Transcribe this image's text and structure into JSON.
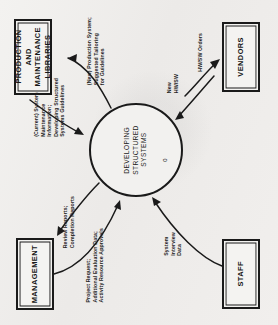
{
  "diagram": {
    "type": "data-flow-diagram",
    "level": "context",
    "orientation": "rotated-90-counterclockwise",
    "process": {
      "name": "DEVELOPING\nSTRUCTURED\nSYSTEMS",
      "id": "0"
    },
    "entities": [
      {
        "key": "production",
        "label": "PRODUCTION\nAND\nMAINTENANCE\nLIBRARIES"
      },
      {
        "key": "vendors",
        "label": "VENDORS"
      },
      {
        "key": "management",
        "label": "MANAGEMENT"
      },
      {
        "key": "staff",
        "label": "STAFF"
      }
    ],
    "flows": [
      {
        "key": "current_system",
        "label": "(Current) System\nMaintenance\nInformation;\nDeveloping Structured\nSystems Guidelines",
        "from": "production",
        "to": "process"
      },
      {
        "key": "new_production",
        "label": "(New) Production System;\nSuggested Tailoring\nfor Guidelines",
        "from": "process",
        "to": "production"
      },
      {
        "key": "new_hwsw",
        "label": "New\nHW/SW",
        "from": "vendors",
        "to": "process"
      },
      {
        "key": "hwsw_orders",
        "label": "HW/SW Orders",
        "from": "process",
        "to": "vendors"
      },
      {
        "key": "review_reports",
        "label": "Review Reports;\nCompletion Reports",
        "from": "process",
        "to": "management"
      },
      {
        "key": "project_request",
        "label": "Project Request;\nAdditional Evaluation Data;\nActivity Resource Approvals",
        "from": "management",
        "to": "process"
      },
      {
        "key": "system_interview",
        "label": "System\nInterview\nData",
        "from": "staff",
        "to": "process"
      }
    ]
  }
}
